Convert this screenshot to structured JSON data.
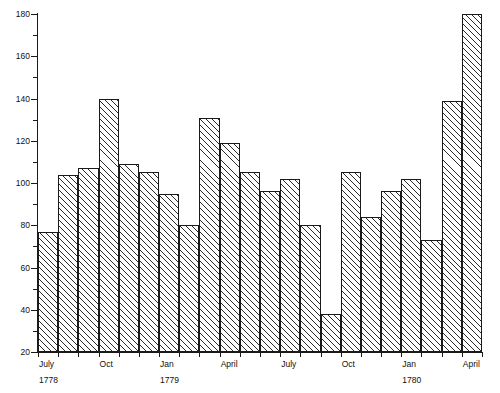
{
  "chart_data": {
    "type": "bar",
    "title": "",
    "subtitle": "",
    "xlabel": "",
    "ylabel": "",
    "grid": false,
    "legend": "none",
    "ylim": [
      20,
      180
    ],
    "ytick_step": 20,
    "yminor_step": 10,
    "ytick_labels": [
      "20",
      "40",
      "60",
      "80",
      "100",
      "120",
      "140",
      "160",
      "180"
    ],
    "ytick_values": [
      20,
      40,
      60,
      80,
      100,
      120,
      140,
      160,
      180
    ],
    "xtick_labels": [
      {
        "label": "July",
        "year": "1778",
        "index": 0
      },
      {
        "label": "Oct",
        "year": "",
        "index": 3
      },
      {
        "label": "Jan",
        "year": "1779",
        "index": 6
      },
      {
        "label": "April",
        "year": "",
        "index": 9
      },
      {
        "label": "July",
        "year": "",
        "index": 12
      },
      {
        "label": "Oct",
        "year": "",
        "index": 15
      },
      {
        "label": "Jan",
        "year": "1780",
        "index": 18
      },
      {
        "label": "April",
        "year": "",
        "index": 21
      }
    ],
    "categories": [
      "July 1778",
      "Aug 1778",
      "Sept 1778",
      "Oct 1778",
      "Nov 1778",
      "Dec 1778",
      "Jan 1779",
      "Feb 1779",
      "March 1779",
      "April 1779",
      "May 1779",
      "June 1779",
      "July 1779",
      "Aug 1779",
      "Sept 1779",
      "Oct 1779",
      "Nov 1779",
      "Dec 1779",
      "Jan 1780",
      "Feb 1780",
      "March 1780",
      "April 1780"
    ],
    "values": [
      77,
      104,
      107,
      140,
      109,
      105,
      95,
      80,
      131,
      119,
      105,
      96,
      102,
      80,
      38,
      105,
      84,
      96,
      102,
      73,
      139,
      180
    ],
    "bar_style": {
      "fill": "diagonal-hatch",
      "edge_color": "#1a1a1a",
      "face_color": "#ffffff"
    }
  }
}
